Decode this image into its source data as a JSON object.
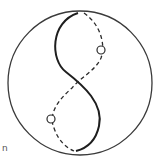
{
  "diagram": {
    "type": "line-drawing",
    "colors": {
      "stroke": "#2a2a2a",
      "background": "#ffffff"
    },
    "outer_circle": {
      "cx": 80,
      "cy": 83,
      "r": 72
    },
    "small_circles": [
      {
        "cx": 101,
        "cy": 50,
        "r": 4
      },
      {
        "cx": 51,
        "cy": 119,
        "r": 4
      }
    ],
    "corner_label": "n"
  }
}
